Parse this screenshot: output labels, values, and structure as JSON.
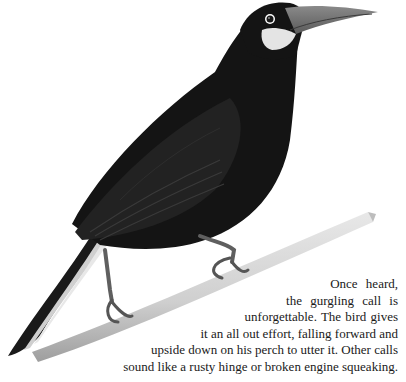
{
  "illustration": {
    "subject": "bird-perched-on-branch",
    "colors": {
      "plumage": "#151515",
      "plumage_highlight": "#2a2a2a",
      "cheek_patch": "#e6e6e6",
      "beak": "#777777",
      "branch": "#d6d6d6",
      "branch_shadow": "#a8a8a8",
      "legs": "#6a6a6a"
    }
  },
  "text": {
    "lines": [
      "Once heard,",
      "the gurgling call is",
      "unforgettable. The bird gives",
      "it an all out effort, falling forward and",
      "upside down on his perch to utter it. Other calls",
      "sound like a rusty hinge or broken engine squeaking."
    ]
  }
}
